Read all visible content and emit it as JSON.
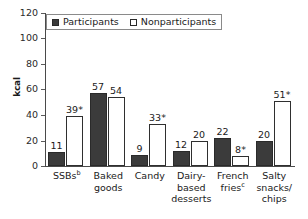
{
  "chart_data": {
    "type": "bar",
    "title": "",
    "xlabel": "",
    "ylabel": "kcal",
    "ylim": [
      0,
      120
    ],
    "yticks": [
      0,
      20,
      40,
      60,
      80,
      100,
      120
    ],
    "grid": false,
    "legend_position": "top-left",
    "categories": [
      "SSBsᵇ",
      "Baked goods",
      "Candy",
      "Dairy-based desserts",
      "French friesᶜ",
      "Salty snacks/chips"
    ],
    "category_lines": [
      [
        "SSBs",
        "b"
      ],
      [
        "Baked",
        "goods"
      ],
      [
        "Candy"
      ],
      [
        "Dairy-",
        "based",
        "desserts"
      ],
      [
        "French",
        "fries",
        "c"
      ],
      [
        "Salty",
        "snacks/",
        "chips"
      ]
    ],
    "series": [
      {
        "name": "Participants",
        "color": "#3b3b3b",
        "values": [
          11,
          57,
          9,
          12,
          22,
          20
        ],
        "labels": [
          "11",
          "57",
          "9",
          "12",
          "22",
          "20"
        ]
      },
      {
        "name": "Nonparticipants",
        "color": "#ffffff",
        "values": [
          39,
          54,
          33,
          20,
          8,
          51
        ],
        "labels": [
          "39*",
          "54",
          "33*",
          "20",
          "8*",
          "51*"
        ]
      }
    ],
    "annotations": {
      "asterisk_note": "*",
      "footnote_markers": [
        "b",
        "c"
      ]
    }
  },
  "legend": {
    "items": [
      {
        "label": "Participants",
        "style": "filled"
      },
      {
        "label": "Nonparticipants",
        "style": "open"
      }
    ]
  },
  "axis": {
    "y_title": "kcal",
    "y_tick_labels": [
      "120",
      "100",
      "80",
      "60",
      "40",
      "20",
      "0"
    ]
  }
}
